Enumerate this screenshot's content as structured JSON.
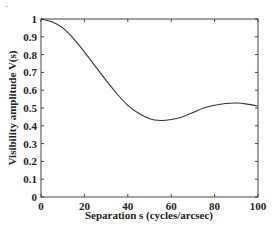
{
  "corner_mark": "\"",
  "chart_data": {
    "type": "line",
    "title": "",
    "xlabel": "Separation s (cycles/arcsec)",
    "ylabel": "Visibility amplitude V(s)",
    "xlim": [
      0,
      100
    ],
    "ylim": [
      0,
      1
    ],
    "xticks": [
      0,
      20,
      40,
      60,
      80,
      100
    ],
    "yticks": [
      0,
      0.1,
      0.2,
      0.3,
      0.4,
      0.5,
      0.6,
      0.7,
      0.8,
      0.9,
      1
    ],
    "ytick_labels": [
      "0",
      "0.1",
      "0.2",
      "0.3",
      "0.4",
      "0.5",
      "0.6",
      "0.7",
      "0.8",
      "0.9",
      "1"
    ],
    "xtick_labels": [
      "0",
      "20",
      "40",
      "60",
      "80",
      "100"
    ],
    "grid": false,
    "legend": null,
    "series": [
      {
        "name": "V(s)",
        "color": "#333333",
        "x": [
          0,
          5,
          10,
          15,
          20,
          25,
          30,
          35,
          40,
          45,
          50,
          55,
          60,
          65,
          70,
          75,
          80,
          85,
          90,
          95,
          100
        ],
        "values": [
          1.0,
          0.985,
          0.95,
          0.89,
          0.815,
          0.735,
          0.655,
          0.58,
          0.515,
          0.47,
          0.44,
          0.43,
          0.435,
          0.45,
          0.475,
          0.5,
          0.515,
          0.525,
          0.528,
          0.522,
          0.51
        ]
      }
    ]
  }
}
